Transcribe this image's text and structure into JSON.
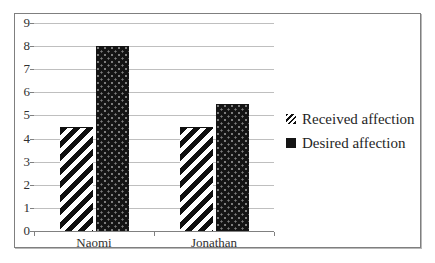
{
  "chart_data": {
    "type": "bar",
    "title": "",
    "xlabel": "",
    "ylabel": "",
    "categories": [
      "Naomi",
      "Jonathan"
    ],
    "series": [
      {
        "name": "Received affection",
        "values": [
          4.5,
          4.5
        ],
        "pattern": "diagonal-hatch",
        "color": "#0f0f0f"
      },
      {
        "name": "Desired affection",
        "values": [
          8,
          5.5
        ],
        "pattern": "dots-on-black",
        "color": "#141414"
      }
    ],
    "ylim": [
      0,
      9
    ],
    "y_ticks": [
      0,
      1,
      2,
      3,
      4,
      5,
      6,
      7,
      8,
      9
    ],
    "grid": "horizontal",
    "legend_position": "right"
  },
  "colors": {
    "background": "#ffffff",
    "frame_border": "#7f7f7f",
    "gridline": "#bfbfbf",
    "axis": "#808080",
    "text": "#303030"
  }
}
